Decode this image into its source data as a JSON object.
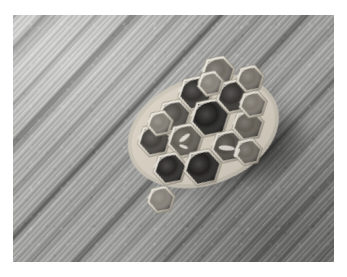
{
  "image": {
    "kind": "photograph",
    "title": "Paper wasp nest comb on wooden board",
    "color_mode": "black-and-white",
    "width": 347,
    "height": 277,
    "frame": {
      "style": "white-border",
      "color": "#ffffff",
      "left": 13,
      "top": 15,
      "right": 13,
      "bottom": 15
    },
    "photo_area": {
      "left": 13,
      "top": 15,
      "width": 321,
      "height": 247
    }
  },
  "scene": {
    "background": {
      "name": "weathered-wood-board",
      "description": "Grey weathered wooden planks with fine grain striations running diagonally from upper-left to lower-right",
      "grain_angle_deg": 133,
      "tone_light": "#c8c8c6",
      "tone_mid": "#a8a8a6",
      "tone_dark": "#8a8a88",
      "seam_color": "#595957"
    },
    "shadow": {
      "name": "cast-shadow",
      "description": "Soft dark cast shadow spreading down-right from the nest",
      "color": "#4a4a48",
      "opacity": 0.42
    },
    "subject": {
      "name": "wasp-nest-comb",
      "description": "Small hexagonal paper wasp comb with open and capped brood cells, tilted about 20 degrees",
      "rim_color": "#efebe2",
      "wall_color": "#d8d2c5",
      "cell_dark": "#1d1b19",
      "cell_mid": "#4e4a45",
      "cell_light": "#8d877c",
      "rotation_deg": -20,
      "cell_count": 17,
      "cells": [
        {
          "id": "c1",
          "cx": 168,
          "cy": 92,
          "r": 15,
          "tone": "#4a4640",
          "label": "open-cell"
        },
        {
          "id": "c2",
          "cx": 196,
          "cy": 78,
          "r": 16,
          "tone": "#2b2926",
          "label": "open-cell"
        },
        {
          "id": "c3",
          "cx": 224,
          "cy": 66,
          "r": 15,
          "tone": "#6b665d",
          "label": "capped-cell"
        },
        {
          "id": "c4",
          "cx": 141,
          "cy": 108,
          "r": 15,
          "tone": "#3d3a35",
          "label": "open-cell"
        },
        {
          "id": "c5",
          "cx": 170,
          "cy": 119,
          "r": 16,
          "tone": "#5e594f",
          "label": "capped-cell"
        },
        {
          "id": "c6",
          "cx": 201,
          "cy": 106,
          "r": 18,
          "tone": "#191816",
          "label": "deep-cell"
        },
        {
          "id": "c7",
          "cx": 231,
          "cy": 94,
          "r": 16,
          "tone": "#2e2b28",
          "label": "open-cell"
        },
        {
          "id": "c8",
          "cx": 252,
          "cy": 83,
          "r": 12,
          "tone": "#767066",
          "label": "edge-cell"
        },
        {
          "id": "c9",
          "cx": 146,
          "cy": 140,
          "r": 15,
          "tone": "#201e1c",
          "label": "deep-cell"
        },
        {
          "id": "c10",
          "cx": 177,
          "cy": 150,
          "r": 17,
          "tone": "#1b1917",
          "label": "deep-cell"
        },
        {
          "id": "c11",
          "cx": 208,
          "cy": 139,
          "r": 15,
          "tone": "#4c4740",
          "label": "open-cell"
        },
        {
          "id": "c12",
          "cx": 234,
          "cy": 126,
          "r": 14,
          "tone": "#625c52",
          "label": "capped-cell"
        },
        {
          "id": "c13",
          "cx": 127,
          "cy": 166,
          "r": 12,
          "tone": "#8a847a",
          "label": "edge-cell"
        },
        {
          "id": "c14",
          "cx": 246,
          "cy": 108,
          "r": 12,
          "tone": "#7e786d",
          "label": "edge-cell"
        },
        {
          "id": "c15",
          "cx": 213,
          "cy": 74,
          "r": 11,
          "tone": "#857f75",
          "label": "edge-cell"
        },
        {
          "id": "c16",
          "cx": 152,
          "cy": 94,
          "r": 11,
          "tone": "#817b71",
          "label": "edge-cell"
        },
        {
          "id": "c17",
          "cx": 225,
          "cy": 151,
          "r": 12,
          "tone": "#6e685e",
          "label": "edge-cell"
        }
      ]
    }
  }
}
